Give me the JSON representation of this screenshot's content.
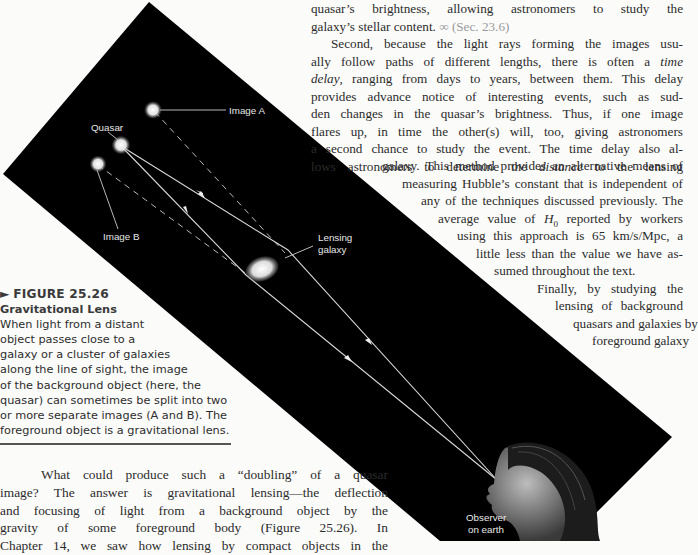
{
  "page": {
    "top_paragraph": {
      "lines": [
        "quasar’s brightness, allowing astronomers to study the",
        "galaxy’s stellar content."
      ],
      "xref_icon": "∞",
      "xref": "(Sec. 23.6)"
    },
    "second_paragraph": {
      "lines": [
        "Second, because the light rays forming the images usu-",
        "ally follow paths of different lengths, there is often a",
        "delay",
        ", ranging from days to years, between them. This delay",
        "provides advance notice of interesting events, such as sud-",
        "den changes in the quasar’s brightness. Thus, if one image",
        "flares up, in time the other(s) will, too, giving astronomers",
        "a second chance to study the event. The time delay also al-",
        "lows astronomers to determine the",
        "distance",
        "to the lensing",
        "galaxy. This method provides an alternative means of",
        "measuring Hubble’s constant that is independent of",
        "any of the techniques discussed previously. The",
        "average value of",
        "H",
        "0",
        "reported by workers",
        "using this approach is 65 km/s/Mpc, a",
        "little less than the value we have as-",
        "sumed throughout the text."
      ],
      "italic_time": "time"
    },
    "third_paragraph": {
      "lines": [
        "Finally, by studying the",
        "lensing of background",
        "quasars and galaxies by",
        "foreground galaxy"
      ]
    },
    "bottom_paragraph": {
      "lines": [
        "What could produce such a “doubling” of a quasar",
        "image? The answer is gravitational lensing—the deflection",
        "and focusing of light from a background object by the",
        "gravity of some foreground body (Figure 25.26). In",
        "Chapter 14, we saw how lensing by compact objects in the"
      ]
    },
    "figure": {
      "marker": "►",
      "number": "FIGURE 25.26",
      "title": "Gravitational Lens",
      "caption": [
        "When light from a distant",
        "object passes close to a",
        "galaxy or a cluster of galaxies",
        "along the line of sight, the image",
        "of the background object (here, the",
        "quasar) can sometimes be split into two",
        "or more separate images (A and B). The",
        "foreground object is a gravitational lens."
      ],
      "labels": {
        "image_a": "Image A",
        "quasar": "Quasar",
        "image_b": "Image B",
        "lensing_1": "Lensing",
        "lensing_2": "galaxy",
        "observer_1": "Observer",
        "observer_2": "on earth"
      },
      "colors": {
        "background": "#000000",
        "ray": "#d8d8d8",
        "page": "#fbfbfa"
      }
    }
  }
}
